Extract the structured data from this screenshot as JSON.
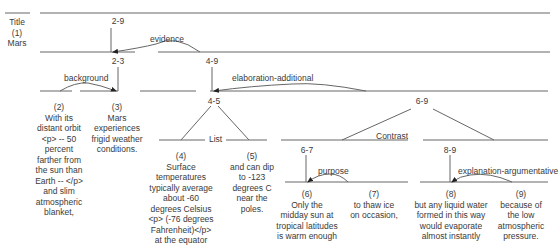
{
  "title": {
    "label": "Title",
    "num": "(1)",
    "text": "Mars"
  },
  "spans": {
    "s2_9": "2-9",
    "s2_3": "2-3",
    "s4_9": "4-9",
    "s4_5": "4-5",
    "s6_9": "6-9",
    "s6_7": "6-7",
    "s8_9": "8-9"
  },
  "relations": {
    "evidence": "evidence",
    "background": "background",
    "elaboration": "elaboration-additional",
    "list": "List",
    "contrast": "Contrast",
    "purpose": "purpose",
    "explanation": "explanation-argumentative"
  },
  "segments": [
    {
      "num": "(2)",
      "lines": [
        "With its",
        "distant orbit",
        "<p> -- 50",
        "percent",
        "farther from",
        "the sun than",
        "Earth -- </p>",
        "and slim",
        "atmospheric",
        "blanket,"
      ]
    },
    {
      "num": "(3)",
      "lines": [
        "Mars",
        "experiences",
        "frigid weather",
        "conditions."
      ]
    },
    {
      "num": "(4)",
      "lines": [
        "Surface",
        "temperatures",
        "typically average",
        "about -60",
        "degrees Celsius",
        "<p> (-76 degrees",
        "Fahrenheit)</p>",
        "at the equator"
      ]
    },
    {
      "num": "(5)",
      "lines": [
        "and can dip",
        "to -123",
        "degrees C",
        "near the",
        "poles."
      ]
    },
    {
      "num": "(6)",
      "lines": [
        "Only the",
        "midday sun at",
        "tropical latitudes",
        "is warm enough"
      ]
    },
    {
      "num": "(7)",
      "lines": [
        "to thaw ice",
        "on occasion,"
      ]
    },
    {
      "num": "(8)",
      "lines": [
        "but any liquid water",
        "formed in this way",
        "would evaporate",
        "almost instantly"
      ]
    },
    {
      "num": "(9)",
      "lines": [
        "because of",
        "the low",
        "atmospheric",
        "pressure."
      ]
    }
  ],
  "colors": {
    "line": "#555555",
    "text": "#3a3a3a"
  }
}
